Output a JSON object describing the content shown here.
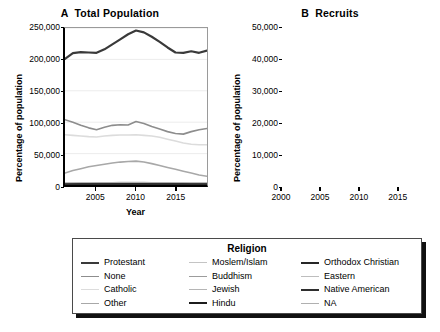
{
  "figure": {
    "legend": {
      "title": "Religion",
      "columns": [
        [
          {
            "label": "Protestant",
            "color": "#3a3a3a",
            "width": 2.2
          },
          {
            "label": "None",
            "color": "#8d8d8d",
            "width": 1.6
          },
          {
            "label": "Catholic",
            "color": "#dcdcdc",
            "width": 1.6
          },
          {
            "label": "Other",
            "color": "#a8a8a8",
            "width": 1.6
          }
        ],
        [
          {
            "label": "Moslem/Islam",
            "color": "#c4c4c4",
            "width": 1.6
          },
          {
            "label": "Buddhism",
            "color": "#9c9c9c",
            "width": 1.6
          },
          {
            "label": "Jewish",
            "color": "#b5b5b5",
            "width": 1.6
          },
          {
            "label": "Hindu",
            "color": "#1c1c1c",
            "width": 2.4
          }
        ],
        [
          {
            "label": "Orthodox Christian",
            "color": "#262626",
            "width": 2.4
          },
          {
            "label": "Eastern",
            "color": "#bdbdbd",
            "width": 1.6
          },
          {
            "label": "Native American",
            "color": "#2e2e2e",
            "width": 2.4
          },
          {
            "label": "NA",
            "color": "#b0b0b0",
            "width": 1.6
          }
        ]
      ]
    }
  },
  "chart_data": [
    {
      "type": "line",
      "panel": "A",
      "title": "A  Total Population",
      "xlabel": "Year",
      "ylabel": "Percentage of population",
      "xlim": [
        2001,
        2019
      ],
      "ylim": [
        0,
        250000
      ],
      "yticks": [
        0,
        50000,
        100000,
        150000,
        200000,
        250000
      ],
      "ytick_labels": [
        "0",
        "50,000",
        "100,000",
        "150,000",
        "200,000",
        "250,000"
      ],
      "xticks": [
        2005,
        2010,
        2015
      ],
      "xtick_labels": [
        "2005",
        "2010",
        "2015"
      ],
      "grid": "horizontal",
      "legend_position": "below",
      "x": [
        2001,
        2002,
        2003,
        2004,
        2005,
        2006,
        2007,
        2008,
        2009,
        2010,
        2011,
        2012,
        2013,
        2014,
        2015,
        2016,
        2017,
        2018,
        2019
      ],
      "series": [
        {
          "name": "Protestant",
          "color": "#3a3a3a",
          "width": 2.2,
          "values": [
            201000,
            210000,
            211500,
            211000,
            210500,
            216000,
            224000,
            232000,
            240000,
            246000,
            243000,
            236000,
            228000,
            219000,
            211000,
            210500,
            213000,
            210500,
            214000
          ]
        },
        {
          "name": "None",
          "color": "#8d8d8d",
          "width": 1.6,
          "values": [
            104000,
            100000,
            95000,
            91000,
            88000,
            92000,
            95000,
            96000,
            95500,
            101000,
            98000,
            93000,
            89000,
            85000,
            82000,
            81000,
            85000,
            88000,
            90000
          ]
        },
        {
          "name": "Catholic",
          "color": "#dcdcdc",
          "width": 1.6,
          "values": [
            80000,
            79000,
            78000,
            77000,
            76500,
            78000,
            79000,
            79500,
            79500,
            80000,
            79000,
            78000,
            76000,
            73000,
            70000,
            67000,
            65000,
            64000,
            64000
          ]
        },
        {
          "name": "Other",
          "color": "#a8a8a8",
          "width": 1.6,
          "values": [
            19000,
            23000,
            26000,
            29000,
            31000,
            33000,
            35000,
            36500,
            37500,
            38000,
            36500,
            34000,
            31000,
            28000,
            25000,
            22000,
            19000,
            16000,
            14000
          ]
        },
        {
          "name": "Moslem/Islam",
          "color": "#c4c4c4",
          "width": 1.6,
          "values": [
            2500,
            2600,
            2700,
            2800,
            2900,
            3000,
            3100,
            3200,
            3300,
            3400,
            3400,
            3300,
            3200,
            3100,
            3000,
            2900,
            2800,
            2700,
            2600
          ]
        },
        {
          "name": "Buddhism",
          "color": "#9c9c9c",
          "width": 1.6,
          "values": [
            2000,
            2100,
            2200,
            2300,
            2400,
            2500,
            2600,
            2700,
            2800,
            2800,
            2700,
            2600,
            2500,
            2400,
            2300,
            2200,
            2100,
            2000,
            1900
          ]
        },
        {
          "name": "Jewish",
          "color": "#b5b5b5",
          "width": 1.6,
          "values": [
            1600,
            1600,
            1700,
            1700,
            1800,
            1800,
            1900,
            1900,
            2000,
            2000,
            1900,
            1900,
            1800,
            1700,
            1700,
            1600,
            1500,
            1500,
            1400
          ]
        },
        {
          "name": "Hindu",
          "color": "#1c1c1c",
          "width": 2.0,
          "values": [
            600,
            650,
            700,
            750,
            800,
            850,
            900,
            950,
            1000,
            1000,
            1000,
            950,
            900,
            900,
            850,
            800,
            800,
            750,
            700
          ]
        },
        {
          "name": "Orthodox Christian",
          "color": "#262626",
          "width": 2.0,
          "values": [
            900,
            950,
            1000,
            1050,
            1100,
            1150,
            1200,
            1250,
            1300,
            1300,
            1250,
            1200,
            1150,
            1100,
            1050,
            1000,
            950,
            900,
            850
          ]
        },
        {
          "name": "Eastern",
          "color": "#bdbdbd",
          "width": 1.6,
          "values": [
            1200,
            1250,
            1300,
            1350,
            1400,
            1450,
            1500,
            1550,
            1600,
            1600,
            1550,
            1500,
            1450,
            1400,
            1350,
            1300,
            1250,
            1200,
            1150
          ]
        },
        {
          "name": "Native American",
          "color": "#2e2e2e",
          "width": 2.0,
          "values": [
            700,
            750,
            800,
            850,
            900,
            950,
            1000,
            1050,
            1100,
            1100,
            1050,
            1000,
            950,
            900,
            850,
            800,
            750,
            700,
            650
          ]
        },
        {
          "name": "NA",
          "color": "#b0b0b0",
          "width": 1.6,
          "values": [
            3000,
            3100,
            3200,
            3300,
            3400,
            3500,
            3600,
            3700,
            3800,
            3800,
            3700,
            3600,
            3500,
            3400,
            3300,
            3200,
            3100,
            3000,
            2900
          ]
        }
      ]
    },
    {
      "type": "line",
      "panel": "B",
      "title": "B  Recruits",
      "xlabel": "Year",
      "ylabel": "Percentage of population",
      "xlim": [
        2000,
        2019
      ],
      "ylim": [
        0,
        50000
      ],
      "yticks": [
        0,
        10000,
        20000,
        30000,
        40000,
        50000
      ],
      "ytick_labels": [
        "0",
        "10,000",
        "20,000",
        "30,000",
        "40,000",
        "50,000"
      ],
      "xticks": [
        2000,
        2005,
        2010,
        2015
      ],
      "xtick_labels": [
        "2000",
        "2005",
        "2010",
        "2015"
      ],
      "grid": "horizontal",
      "legend_position": "below",
      "x": [
        2000,
        2001,
        2002,
        2003,
        2004,
        2005,
        2006,
        2007,
        2008,
        2009,
        2010,
        2011,
        2012,
        2013,
        2014,
        2015,
        2016,
        2017,
        2018,
        2019
      ],
      "series": [
        {
          "name": "Protestant",
          "color": "#3a3a3a",
          "width": 2.0,
          "values": [
            39500,
            41000,
            40000,
            35500,
            32000,
            29500,
            33000,
            35500,
            31500,
            36000,
            38500,
            37000,
            32500,
            29500,
            33000,
            30000,
            30500,
            31000,
            31500,
            22800
          ]
        },
        {
          "name": "None",
          "color": "#8d8d8d",
          "width": 1.6,
          "values": [
            20000,
            19000,
            17000,
            15000,
            13000,
            12500,
            14500,
            16000,
            14500,
            16500,
            16500,
            15000,
            13000,
            12500,
            14000,
            13000,
            14500,
            16000,
            15800,
            12000
          ]
        },
        {
          "name": "Catholic",
          "color": "#dcdcdc",
          "width": 1.6,
          "values": [
            15500,
            14500,
            13500,
            12500,
            11500,
            11000,
            11500,
            12000,
            11000,
            11500,
            11500,
            11000,
            10000,
            9500,
            9500,
            9200,
            9000,
            8800,
            8500,
            8000
          ]
        },
        {
          "name": "Other",
          "color": "#a8a8a8",
          "width": 1.6,
          "values": [
            9000,
            8800,
            8500,
            8200,
            7500,
            7000,
            7200,
            6800,
            6500,
            6000,
            5500,
            5000,
            4500,
            4200,
            3800,
            3500,
            3000,
            2200,
            1500,
            500
          ]
        },
        {
          "name": "Moslem/Islam",
          "color": "#c4c4c4",
          "width": 1.6,
          "values": [
            7000,
            6800,
            6500,
            6200,
            5800,
            5500,
            5200,
            5000,
            4800,
            4500,
            4200,
            4000,
            3800,
            3500,
            3200,
            3000,
            2800,
            2500,
            2200,
            1800
          ]
        },
        {
          "name": "Buddhism",
          "color": "#9c9c9c",
          "width": 1.6,
          "values": [
            900,
            880,
            860,
            840,
            820,
            800,
            780,
            760,
            740,
            720,
            700,
            680,
            660,
            640,
            620,
            600,
            580,
            560,
            540,
            500
          ]
        },
        {
          "name": "Jewish",
          "color": "#b5b5b5",
          "width": 1.6,
          "values": [
            700,
            690,
            680,
            670,
            660,
            650,
            640,
            630,
            620,
            610,
            600,
            590,
            580,
            570,
            560,
            550,
            540,
            530,
            520,
            500
          ]
        },
        {
          "name": "Hindu",
          "color": "#1c1c1c",
          "width": 1.8,
          "values": [
            300,
            310,
            320,
            330,
            340,
            350,
            360,
            370,
            380,
            390,
            380,
            370,
            360,
            350,
            340,
            330,
            320,
            310,
            300,
            280
          ]
        },
        {
          "name": "Orthodox Christian",
          "color": "#262626",
          "width": 1.8,
          "values": [
            400,
            410,
            420,
            430,
            440,
            450,
            460,
            470,
            480,
            490,
            480,
            470,
            460,
            450,
            440,
            430,
            420,
            410,
            400,
            380
          ]
        },
        {
          "name": "Eastern",
          "color": "#bdbdbd",
          "width": 1.6,
          "values": [
            600,
            610,
            620,
            630,
            640,
            650,
            660,
            670,
            680,
            690,
            680,
            670,
            660,
            650,
            640,
            630,
            620,
            610,
            600,
            580
          ]
        },
        {
          "name": "Native American",
          "color": "#2e2e2e",
          "width": 1.8,
          "values": [
            350,
            360,
            370,
            380,
            390,
            400,
            410,
            420,
            430,
            440,
            430,
            420,
            410,
            400,
            390,
            380,
            370,
            360,
            350,
            330
          ]
        },
        {
          "name": "NA",
          "color": "#b0b0b0",
          "width": 1.6,
          "values": [
            1200,
            1250,
            1300,
            1350,
            1400,
            1450,
            1500,
            1450,
            1400,
            1350,
            1300,
            1250,
            1200,
            1150,
            1100,
            1050,
            1000,
            950,
            900,
            850
          ]
        }
      ]
    }
  ]
}
